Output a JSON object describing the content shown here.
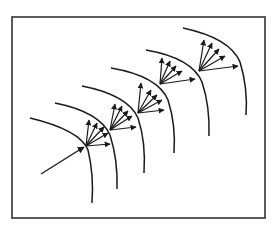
{
  "diagram": {
    "type": "wavefront-cascade",
    "colors": {
      "stroke": "#1a1a1a",
      "frame": "#333333",
      "background": "#ffffff"
    },
    "frame": {
      "x": 12,
      "y": 17,
      "width": 253,
      "height": 201
    },
    "incoming_arrow": {
      "from": [
        41,
        174
      ],
      "to": [
        84,
        147
      ]
    },
    "curves": [
      {
        "id": "curve-1",
        "d": "M30,118 Q80,130 88,150 Q94,175 92,203"
      },
      {
        "id": "curve-2",
        "d": "M55,103 Q100,112 110,135 Q118,160 117,189"
      },
      {
        "id": "curve-3",
        "d": "M82,86 Q128,95 138,118 Q146,142 144,173"
      },
      {
        "id": "curve-4",
        "d": "M111,68 Q158,76 168,100 Q176,125 174,153"
      },
      {
        "id": "curve-5",
        "d": "M146,50 Q192,58 202,82 Q210,106 209,136"
      },
      {
        "id": "curve-6",
        "d": "M183,28 Q230,38 240,62 Q248,88 246,115"
      }
    ],
    "fans": [
      {
        "id": "fan-1",
        "origin": [
          86,
          146
        ],
        "tips": [
          [
            89,
            120
          ],
          [
            97,
            123
          ],
          [
            104,
            127
          ],
          [
            108,
            133
          ],
          [
            110,
            144
          ]
        ]
      },
      {
        "id": "fan-2",
        "origin": [
          110,
          130
        ],
        "tips": [
          [
            115,
            104
          ],
          [
            122,
            106
          ],
          [
            128,
            111
          ],
          [
            132,
            116
          ],
          [
            136,
            127
          ]
        ]
      },
      {
        "id": "fan-3",
        "origin": [
          138,
          113
        ],
        "tips": [
          [
            141,
            83
          ],
          [
            151,
            90
          ],
          [
            157,
            95
          ],
          [
            162,
            100
          ],
          [
            164,
            110
          ]
        ]
      },
      {
        "id": "fan-4",
        "origin": [
          160,
          84
        ],
        "tips": [
          [
            162,
            58
          ],
          [
            170,
            61
          ],
          [
            176,
            66
          ],
          [
            182,
            71
          ],
          [
            195,
            79
          ]
        ]
      },
      {
        "id": "fan-5",
        "origin": [
          199,
          71
        ],
        "tips": [
          [
            204,
            40
          ],
          [
            212,
            43
          ],
          [
            219,
            49
          ],
          [
            225,
            56
          ],
          [
            238,
            66
          ]
        ]
      }
    ]
  }
}
